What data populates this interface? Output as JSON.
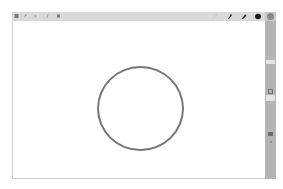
{
  "app": {
    "type": "whiteboard-drawing-canvas"
  },
  "toolbar": {
    "left_tools": [
      {
        "name": "select-tool",
        "icon": "select-icon"
      },
      {
        "name": "undo-tool",
        "icon": "undo-icon"
      },
      {
        "name": "redo-tool",
        "icon": "redo-icon"
      },
      {
        "name": "text-tool",
        "icon": "text-icon"
      },
      {
        "name": "eraser-tool",
        "icon": "eraser-icon"
      }
    ],
    "right_tools": [
      {
        "name": "pencil-light",
        "icon": "pencil-icon",
        "color": "#bdbdbd"
      },
      {
        "name": "pen-fine",
        "icon": "pen-icon",
        "color": "#1a1a1a"
      },
      {
        "name": "pen-medium",
        "icon": "pen-icon",
        "color": "#1a1a1a"
      },
      {
        "name": "marker-bold",
        "icon": "marker-icon",
        "color": "#1a1a1a"
      },
      {
        "name": "color-swatch",
        "icon": "color-circle-icon",
        "color": "#8a8a8a"
      }
    ]
  },
  "sidebar": {
    "items": [
      {
        "name": "color-picker",
        "icon": "color-circle-icon"
      },
      {
        "name": "panel-band-1"
      },
      {
        "name": "shape-tool",
        "icon": "square-icon"
      },
      {
        "name": "layer-tool",
        "icon": "layer-icon"
      },
      {
        "name": "more-tool",
        "icon": "dot-icon"
      }
    ]
  },
  "canvas": {
    "shapes": [
      {
        "type": "circle",
        "stroke": "#767676",
        "cx": 140,
        "cy": 108,
        "rx": 43,
        "ry": 42
      }
    ]
  },
  "colors": {
    "toolbar_bg": "#d9d9d9",
    "sidebar_bg": "#b4b4b4",
    "canvas_bg": "#ffffff",
    "stroke": "#767676"
  }
}
